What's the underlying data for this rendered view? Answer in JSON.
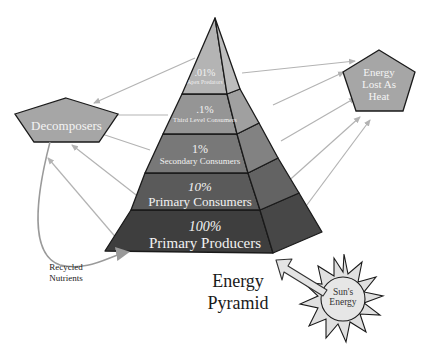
{
  "title": {
    "line1": "Energy",
    "line2": "Pyramid"
  },
  "pyramid_levels": [
    {
      "percent": "100%",
      "name": "Primary Producers",
      "color": "#3e3e3e",
      "side_color": "#474747"
    },
    {
      "percent": "10%",
      "name": "Primary Consumers",
      "color": "#5a5a5a",
      "side_color": "#636363"
    },
    {
      "percent": "1%",
      "name": "Secondary Consumers",
      "color": "#787878",
      "side_color": "#828282"
    },
    {
      "percent": ".1%",
      "name": "Third Level Consumers",
      "color": "#959595",
      "side_color": "#a0a0a0"
    },
    {
      "percent": ".01%",
      "name": "Apex Predators",
      "color": "#b4b4b4",
      "side_color": "#bdbdbd"
    }
  ],
  "nodes": {
    "decomposers": {
      "label": "Decomposers",
      "fill": "#a6a6a6"
    },
    "heat": {
      "line1": "Energy",
      "line2": "Lost As",
      "line3": "Heat",
      "fill": "#a6a6a6"
    },
    "sun": {
      "line1": "Sun's",
      "line2": "Energy",
      "fill": "#e6e6e6"
    }
  },
  "annotations": {
    "recycled_line1": "Recycled",
    "recycled_line2": "Nutrients"
  },
  "colors": {
    "arrow": "#b3b3b3",
    "outline": "#1a1a1a",
    "background": "#ffffff"
  }
}
